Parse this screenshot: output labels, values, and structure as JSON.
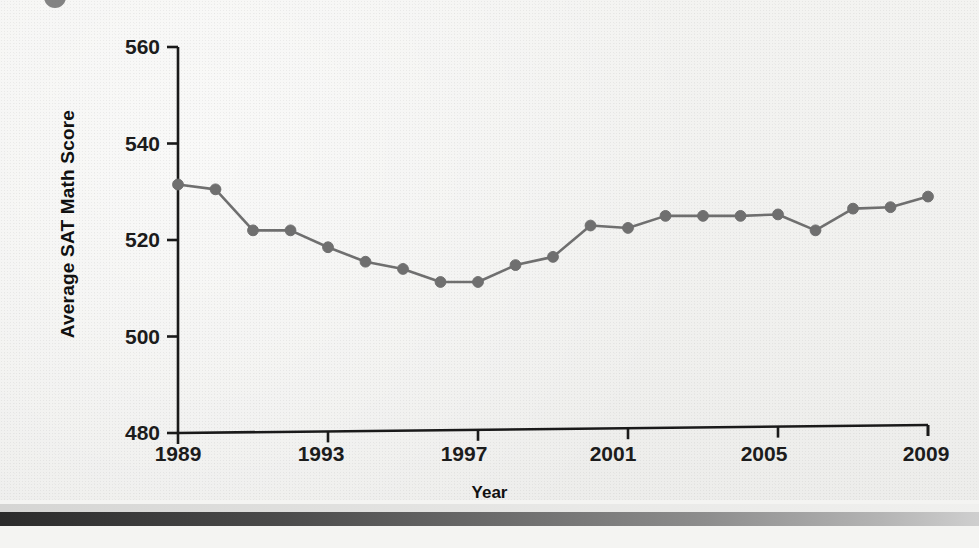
{
  "chart_data": {
    "type": "line",
    "title": "",
    "xlabel": "Year",
    "ylabel": "Average SAT Math Score",
    "xlim": [
      1989,
      2009
    ],
    "ylim": [
      480,
      560
    ],
    "xticks": [
      "1989",
      "1993",
      "1997",
      "2001",
      "2005",
      "2009"
    ],
    "xtick_values": [
      1989,
      1993,
      1997,
      2001,
      2005,
      2009
    ],
    "yticks": [
      "480",
      "500",
      "520",
      "540",
      "560"
    ],
    "ytick_values": [
      480,
      500,
      520,
      540,
      560
    ],
    "grid": false,
    "legend": "none",
    "marker": "circle",
    "series_color": "#6f6f6f",
    "x": [
      1989,
      1990,
      1991,
      1992,
      1993,
      1994,
      1995,
      1996,
      1997,
      1998,
      1999,
      2000,
      2001,
      2002,
      2003,
      2004,
      2005,
      2006,
      2007,
      2008,
      2009
    ],
    "values": [
      531.5,
      530.5,
      522.0,
      522.0,
      518.5,
      515.5,
      514.0,
      511.3,
      511.3,
      514.8,
      516.5,
      523.0,
      522.5,
      525.0,
      525.0,
      525.0,
      525.3,
      522.0,
      526.5,
      526.8,
      529.0
    ],
    "series": [
      {
        "name": "Average SAT Math Score",
        "values": [
          531.5,
          530.5,
          522.0,
          522.0,
          518.5,
          515.5,
          514.0,
          511.3,
          511.3,
          514.8,
          516.5,
          523.0,
          522.5,
          525.0,
          525.0,
          525.0,
          525.3,
          522.0,
          526.5,
          526.8,
          529.0
        ]
      }
    ]
  },
  "axis": {
    "y_title": "Average SAT Math Score",
    "x_title": "Year",
    "y_tick_labels": [
      "560",
      "540",
      "520",
      "500",
      "480"
    ],
    "x_tick_labels": [
      "1989",
      "1993",
      "1997",
      "2001",
      "2005",
      "2009"
    ]
  },
  "colors": {
    "background": "#f2f2f0",
    "axis": "#1a1a1a",
    "series": "#6f6f6f",
    "text": "#111111",
    "bottom_bar_dark": "#2b2b2b",
    "bottom_bar_light": "#cfcfcf"
  }
}
